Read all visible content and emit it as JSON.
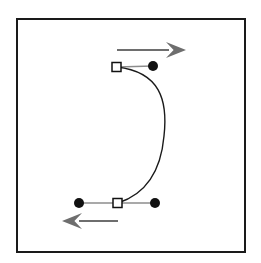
{
  "figure": {
    "width": 261,
    "height": 263,
    "background_color": "#ffffff"
  },
  "frame": {
    "name": "figure-border",
    "x": 17,
    "y": 19,
    "width": 228,
    "height": 233,
    "stroke_color": "#1a1a1a",
    "stroke_width": 2,
    "fill": "none"
  },
  "colors": {
    "curve": "#1a1a1a",
    "handle_line": "#8c8c8c",
    "arrow": "#6e6e6e",
    "anchor_fill": "#ffffff",
    "anchor_stroke": "#111111",
    "control_point_fill": "#111111",
    "frame": "#1a1a1a"
  },
  "curve": {
    "label": "bezier-curve",
    "path": "M 117 67 C 160 72 168 100 164 136 C 161 170 146 194 118 203",
    "stroke_width": 1.4,
    "start_point": [
      117,
      67
    ],
    "end_point": [
      118,
      203
    ],
    "rightmost_x": 164,
    "rightmost_y": 136,
    "shape": "C-shaped arc bulging to the right"
  },
  "anchors": [
    {
      "name": "anchor-point-top",
      "shape": "square",
      "x": 116.5,
      "y": 67,
      "size": 9,
      "fill": "#ffffff",
      "stroke": "#111111"
    },
    {
      "name": "anchor-point-bottom",
      "shape": "square",
      "x": 117.5,
      "y": 203,
      "size": 9,
      "fill": "#ffffff",
      "stroke": "#111111"
    }
  ],
  "control_points": [
    {
      "name": "control-point-top-right",
      "shape": "circle",
      "x": 153,
      "y": 66,
      "radius": 5,
      "fill": "#111111"
    },
    {
      "name": "control-point-bottom-left",
      "shape": "circle",
      "x": 79,
      "y": 203,
      "radius": 5,
      "fill": "#111111"
    },
    {
      "name": "control-point-bottom-right",
      "shape": "circle",
      "x": 155,
      "y": 203,
      "radius": 5,
      "fill": "#111111"
    }
  ],
  "handle_lines": [
    {
      "name": "handle-line-top",
      "x1": 117,
      "y1": 67,
      "x2": 153,
      "y2": 66,
      "stroke": "#8c8c8c",
      "stroke_width": 1.4
    },
    {
      "name": "handle-line-bottom-left",
      "x1": 79,
      "y1": 203,
      "x2": 118,
      "y2": 203,
      "stroke": "#8c8c8c",
      "stroke_width": 1.4
    },
    {
      "name": "handle-line-bottom-right",
      "x1": 118,
      "y1": 203,
      "x2": 155,
      "y2": 203,
      "stroke": "#8c8c8c",
      "stroke_width": 1.4
    }
  ],
  "arrows": [
    {
      "name": "direction-arrow-top-right",
      "direction": "right",
      "tail_x": 117,
      "tail_y": 50,
      "tip_x": 186,
      "tip_y": 50,
      "shaft_width": 2.2,
      "head_length": 20,
      "head_half_width": 8,
      "color": "#6e6e6e"
    },
    {
      "name": "direction-arrow-bottom-left",
      "direction": "left",
      "tail_x": 118,
      "tail_y": 221,
      "tip_x": 62,
      "tip_y": 221,
      "shaft_width": 2.2,
      "head_length": 20,
      "head_half_width": 8,
      "color": "#6e6e6e"
    }
  ]
}
